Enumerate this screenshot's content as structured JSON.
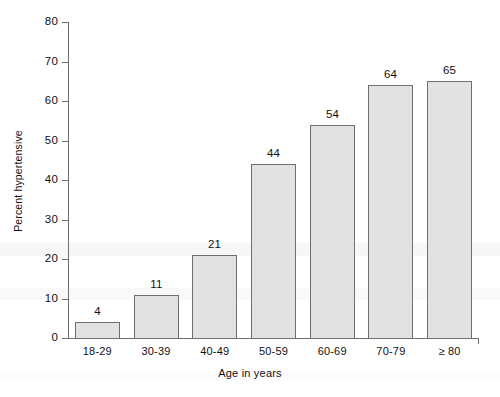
{
  "chart_data": {
    "type": "bar",
    "title": "",
    "xlabel": "Age in years",
    "ylabel": "Percent hypertensive",
    "categories": [
      "18-29",
      "30-39",
      "40-49",
      "50-59",
      "60-69",
      "70-79",
      "≥ 80"
    ],
    "values": [
      4,
      11,
      21,
      44,
      54,
      64,
      65
    ],
    "value_labels": [
      "4",
      "11",
      "21",
      "44",
      "54",
      "64",
      "65"
    ],
    "ylim": [
      0,
      80
    ],
    "ytick_values": [
      0,
      10,
      20,
      30,
      40,
      50,
      60,
      70,
      80
    ],
    "ytick_labels": [
      "0",
      "10",
      "20",
      "30",
      "40",
      "50",
      "60",
      "70",
      "80"
    ],
    "grid": false,
    "legend": null,
    "bar_fill_color": "#e2e2e2",
    "bar_edge_color": "#6f6f6f",
    "axis_color": "#6e6e6e",
    "text_color": "#111111",
    "background_color": "#ffffff"
  }
}
